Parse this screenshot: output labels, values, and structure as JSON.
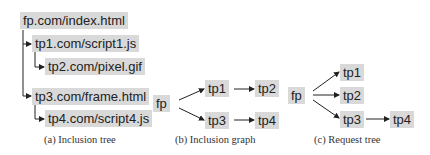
{
  "panels": {
    "a": {
      "caption": "(a) Inclusion tree",
      "nodes": [
        "fp.com/index.html",
        "tp1.com/script1.js",
        "tp2.com/pixel.gif",
        "tp3.com/frame.html",
        "tp4.com/script4.js"
      ]
    },
    "b": {
      "caption": "(b) Inclusion graph",
      "nodes": [
        "fp",
        "tp1",
        "tp2",
        "tp3",
        "tp4"
      ],
      "edges": [
        [
          "fp",
          "tp1"
        ],
        [
          "fp",
          "tp3"
        ],
        [
          "tp1",
          "tp2"
        ],
        [
          "tp3",
          "tp4"
        ]
      ]
    },
    "c": {
      "caption": "(c) Request tree",
      "nodes": [
        "fp",
        "tp1",
        "tp2",
        "tp3",
        "tp4"
      ],
      "edges": [
        [
          "fp",
          "tp1"
        ],
        [
          "fp",
          "tp2"
        ],
        [
          "fp",
          "tp3"
        ],
        [
          "tp3",
          "tp4"
        ]
      ]
    }
  },
  "colors": {
    "node_fill": "#d9d9d9",
    "edge": "#222222"
  }
}
